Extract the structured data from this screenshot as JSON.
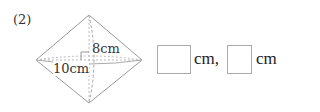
{
  "problem": {
    "number": "(2)",
    "figure": {
      "height_label": "8cm",
      "width_label": "10cm"
    },
    "answers": [
      {
        "value": "",
        "unit": "cm,"
      },
      {
        "value": "",
        "unit": "cm"
      }
    ]
  }
}
